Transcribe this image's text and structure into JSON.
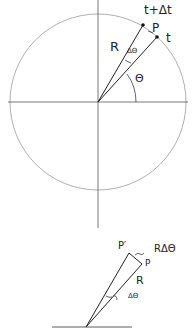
{
  "top_diagram": {
    "description": "Point P moving on a circle of radius R; angle theta from x-axis, small increment delta-theta between times t and t+delta-t",
    "labels": {
      "time_later": "t+Δt",
      "point": "P",
      "time": "t",
      "radius": "R",
      "delta_angle": "ΔΘ",
      "angle": "Θ"
    },
    "colors": {
      "circle": "#9a9a9a",
      "axes": "#555555",
      "lines": "#222222"
    }
  },
  "bottom_diagram": {
    "description": "Enlarged wedge showing arc length R delta-theta between P and P'",
    "labels": {
      "point_prime": "P′",
      "arc_length": "RΔΘ",
      "point": "P",
      "radius": "R",
      "delta_angle": "ΔΘ"
    }
  }
}
